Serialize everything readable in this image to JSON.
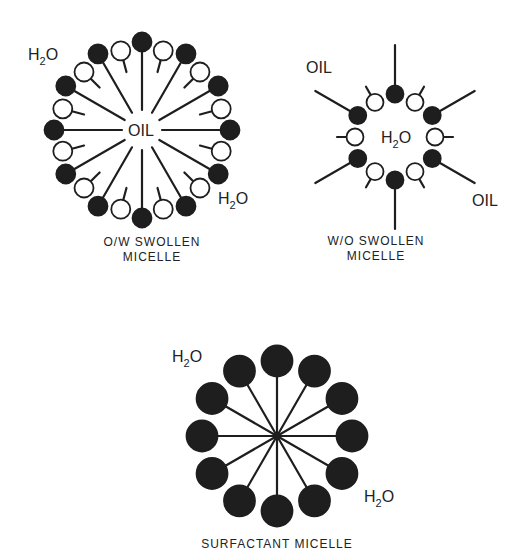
{
  "diagram": {
    "colors": {
      "ink": "#1e1e1e",
      "background": "#ffffff",
      "open_head": "#ffffff"
    },
    "ow_micelle": {
      "caption_line1": "O/W SWOLLEN",
      "caption_line2": "MICELLE",
      "core_label": "OIL",
      "outer_label_1": {
        "text": "H",
        "sub": "2",
        "tail": "O"
      },
      "outer_label_2": {
        "text": "H",
        "sub": "2",
        "tail": "O"
      },
      "center": [
        142,
        130
      ],
      "heads": 24,
      "pattern": "alternating filled/open"
    },
    "wo_micelle": {
      "caption_line1": "W/O SWOLLEN",
      "caption_line2": "MICELLE",
      "core_label": {
        "text": "H",
        "sub": "2",
        "tail": "O"
      },
      "outer_label_1": "OIL",
      "outer_label_2": "OIL",
      "center": [
        395,
        137
      ],
      "heads": 12,
      "pattern": "alternating filled/open"
    },
    "surfactant_micelle": {
      "caption": "SURFACTANT MICELLE",
      "outer_label_1": {
        "text": "H",
        "sub": "2",
        "tail": "O"
      },
      "outer_label_2": {
        "text": "H",
        "sub": "2",
        "tail": "O"
      },
      "center": [
        277,
        436
      ],
      "heads": 12,
      "pattern": "all filled"
    }
  }
}
